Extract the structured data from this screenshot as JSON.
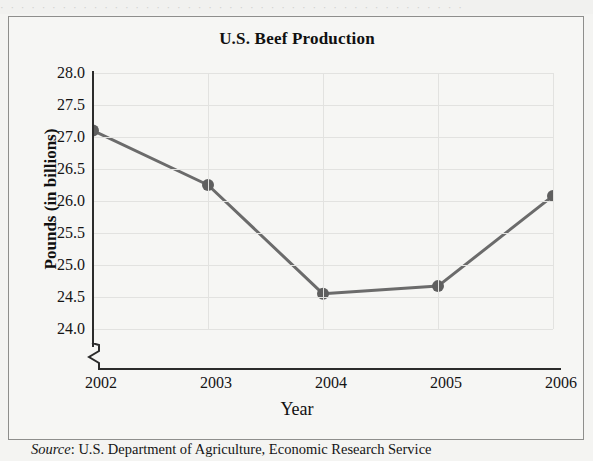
{
  "figure": {
    "title": "U.S. Beef Production",
    "source_label": "Source",
    "source_separator": ": ",
    "source_text": "U.S. Department of Agriculture, Economic Research Service",
    "page_ghost_text": "· · · · · · · · · · · · · · · · · · · · · · · · · · · · · · · · · · · · · · · · · · · · ·"
  },
  "style": {
    "line_color": "#6b6b6b",
    "marker_color": "#5f5f5f",
    "grid_color": "#e2e2e0",
    "axis_color": "#2b2b2b",
    "background": "#f6f6f4"
  },
  "axis": {
    "y_ticks": [
      "28.0",
      "27.5",
      "27.0",
      "26.5",
      "26.0",
      "25.5",
      "25.0",
      "24.5",
      "24.0"
    ],
    "x_ticks": [
      "2002",
      "2003",
      "2004",
      "2005",
      "2006"
    ],
    "y_title": "Pounds (in billions)",
    "x_title": "Year",
    "broken_axis": true
  },
  "chart_data": {
    "type": "line",
    "title": "U.S. Beef Production",
    "xlabel": "Year",
    "ylabel": "Pounds (in billions)",
    "categories": [
      "2002",
      "2003",
      "2004",
      "2005",
      "2006"
    ],
    "x": [
      2002,
      2003,
      2004,
      2005,
      2006
    ],
    "values": [
      27.1,
      26.25,
      24.55,
      24.67,
      26.08
    ],
    "series": [
      {
        "name": "U.S. Beef Production",
        "values": [
          27.1,
          26.25,
          24.55,
          24.67,
          26.08
        ]
      }
    ],
    "ylim": [
      24.0,
      28.0
    ],
    "y_tick_step": 0.5,
    "xlim": [
      2002,
      2006
    ],
    "grid": true,
    "legend": "none",
    "markers": true,
    "axis_break_below": 24.0,
    "source": "U.S. Department of Agriculture, Economic Research Service"
  }
}
